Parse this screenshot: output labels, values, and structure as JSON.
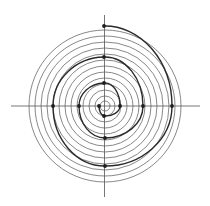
{
  "diagram": {
    "type": "spiral-on-concentric-circles",
    "center": [
      105,
      106
    ],
    "circle_radii": [
      5,
      10,
      16,
      22,
      28,
      34,
      40,
      46,
      52,
      58,
      64,
      70,
      76
    ],
    "axes": {
      "horizontal": {
        "x1": 11,
        "x2": 200,
        "y": 106
      },
      "vertical": {
        "x": 104.5,
        "y1": 15,
        "y2": 197
      }
    },
    "spiral_points": [
      [
        99,
        106
      ],
      [
        104,
        116
      ],
      [
        120,
        106
      ],
      [
        104,
        83
      ],
      [
        79,
        106
      ],
      [
        105,
        138
      ],
      [
        143,
        106
      ],
      [
        104,
        57
      ],
      [
        53,
        106
      ],
      [
        105,
        166
      ],
      [
        172,
        106
      ],
      [
        104,
        26
      ]
    ],
    "colors": {
      "circle": "#6a6a6a",
      "axis": "#555555",
      "spiral": "#2a2a2a",
      "point": "#1e1e1e",
      "background": "#ffffff"
    }
  }
}
